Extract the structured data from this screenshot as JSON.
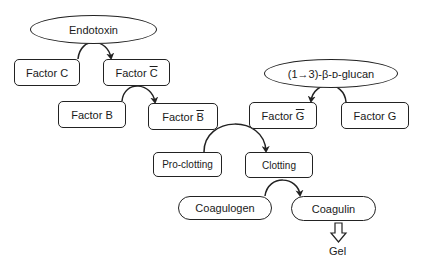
{
  "diagram": {
    "title": "",
    "nodes": {
      "endotoxin": {
        "label": "Endotoxin",
        "shape": "ellipse"
      },
      "factor_c": {
        "label": "Factor C",
        "shape": "box"
      },
      "factor_c_active": {
        "label_prefix": "Factor ",
        "label_symbol": "C",
        "overline": true,
        "shape": "box"
      },
      "factor_b": {
        "label": "Factor B",
        "shape": "box"
      },
      "factor_b_active": {
        "label_prefix": "Factor ",
        "label_symbol": "B",
        "overline": true,
        "shape": "box"
      },
      "glucan": {
        "label": "(1→3)-β-ᴅ-glucan",
        "shape": "ellipse"
      },
      "factor_g_active": {
        "label_prefix": "Factor ",
        "label_symbol": "G",
        "overline": true,
        "shape": "box"
      },
      "factor_g": {
        "label": "Factor G",
        "shape": "box"
      },
      "pro_clotting": {
        "label": "Pro-clotting",
        "shape": "box"
      },
      "clotting": {
        "label": "Clotting",
        "shape": "box"
      },
      "coagulogen": {
        "label": "Coagulogen",
        "shape": "stadium"
      },
      "coagulin": {
        "label": "Coagulin",
        "shape": "stadium"
      },
      "gel": {
        "label": "Gel",
        "shape": "text"
      }
    },
    "edges": [
      {
        "from": "factor_c",
        "to": "factor_c_active",
        "catalyst": "endotoxin",
        "type": "curved-arrow"
      },
      {
        "from": "factor_b",
        "to": "factor_b_active",
        "catalyst": "factor_c_active",
        "type": "curved-arrow"
      },
      {
        "from": "factor_g",
        "to": "factor_g_active",
        "catalyst": "glucan",
        "type": "curved-arrow"
      },
      {
        "from": "pro_clotting",
        "to": "clotting",
        "catalyst": "factor_b_active / factor_g_active",
        "type": "curved-arrow"
      },
      {
        "from": "coagulogen",
        "to": "coagulin",
        "catalyst": "clotting",
        "type": "curved-arrow"
      },
      {
        "from": "coagulin",
        "to": "gel",
        "type": "hollow-block-arrow"
      }
    ],
    "colors": {
      "stroke": "#222222",
      "fill": "#ffffff",
      "text": "#1a1a1a"
    }
  }
}
